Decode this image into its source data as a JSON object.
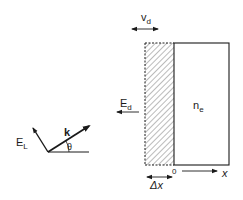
{
  "diagram": {
    "labels": {
      "drift_velocity": "v",
      "drift_velocity_sub": "d",
      "density": "n",
      "density_sub": "e",
      "drift_field": "E",
      "drift_field_sub": "d",
      "origin": "0",
      "x_axis": "x",
      "delta_x": "Δx",
      "wave_vector": "k",
      "laser_field": "E",
      "laser_field_sub": "L",
      "angle": "θ"
    },
    "colors": {
      "ink": "#1a1a1a",
      "background": "#ffffff",
      "hatch": "#555555"
    }
  }
}
